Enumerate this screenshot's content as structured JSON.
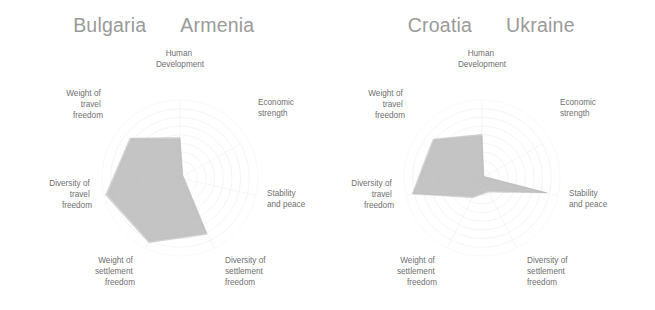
{
  "panels": [
    {
      "titles": [
        "Bulgaria",
        "Armenia"
      ],
      "series": [
        {
          "name": "Bulgaria",
          "values": [
            0.52,
            0.05,
            0.06,
            0.8,
            0.92,
            0.98,
            0.82
          ]
        },
        {
          "name": "Armenia",
          "values": [
            0.5,
            0.04,
            0.05,
            0.78,
            0.9,
            0.95,
            0.8
          ]
        }
      ]
    },
    {
      "titles": [
        "Croatia",
        "Ukraine"
      ],
      "series": [
        {
          "name": "Croatia",
          "values": [
            0.56,
            0.03,
            0.86,
            0.2,
            0.28,
            0.92,
            0.8
          ]
        },
        {
          "name": "Ukraine",
          "values": [
            0.54,
            0.03,
            0.84,
            0.18,
            0.26,
            0.9,
            0.78
          ]
        }
      ]
    }
  ],
  "axes": [
    {
      "id": "human-development",
      "lines": [
        "Human",
        "Development"
      ]
    },
    {
      "id": "economic-strength",
      "lines": [
        "Economic",
        "strength"
      ]
    },
    {
      "id": "stability-and-peace",
      "lines": [
        "Stability",
        "and peace"
      ]
    },
    {
      "id": "diversity-of-settlement-freedom",
      "lines": [
        "Diversity of",
        "settlement",
        "freedom"
      ]
    },
    {
      "id": "weight-of-settlement-freedom",
      "lines": [
        "Weight of",
        "settlement",
        "freedom"
      ]
    },
    {
      "id": "diversity-of-travel-freedom",
      "lines": [
        "Diversity of",
        "travel",
        "freedom"
      ]
    },
    {
      "id": "weight-of-travel-freedom",
      "lines": [
        "Weight of",
        "travel",
        "freedom"
      ]
    }
  ],
  "chart_data": {
    "type": "radar",
    "title": "",
    "charts": [
      {
        "subplot": 1,
        "legend": [
          "Bulgaria",
          "Armenia"
        ],
        "categories": [
          "Human Development",
          "Economic strength",
          "Stability and peace",
          "Diversity of settlement freedom",
          "Weight of settlement freedom",
          "Diversity of travel freedom",
          "Weight of travel freedom"
        ],
        "series": [
          {
            "name": "Bulgaria",
            "values": [
              0.52,
              0.05,
              0.06,
              0.8,
              0.92,
              0.98,
              0.82
            ]
          },
          {
            "name": "Armenia",
            "values": [
              0.5,
              0.04,
              0.05,
              0.78,
              0.9,
              0.95,
              0.8
            ]
          }
        ],
        "rlim": [
          0,
          1
        ],
        "grid": true,
        "grid_rings": 9,
        "legend_position": "top"
      },
      {
        "subplot": 2,
        "legend": [
          "Croatia",
          "Ukraine"
        ],
        "categories": [
          "Human Development",
          "Economic strength",
          "Stability and peace",
          "Diversity of settlement freedom",
          "Weight of settlement freedom",
          "Diversity of travel freedom",
          "Weight of travel freedom"
        ],
        "series": [
          {
            "name": "Croatia",
            "values": [
              0.56,
              0.03,
              0.86,
              0.2,
              0.28,
              0.92,
              0.8
            ]
          },
          {
            "name": "Ukraine",
            "values": [
              0.54,
              0.03,
              0.84,
              0.18,
              0.26,
              0.9,
              0.78
            ]
          }
        ],
        "rlim": [
          0,
          1
        ],
        "grid": true,
        "grid_rings": 9,
        "legend_position": "top"
      }
    ],
    "colors": {
      "fill": "#b9b9b9",
      "grid": "#f0eff1",
      "label_text": "#6f6f6f",
      "title_text": "#9a9a9a",
      "background": "#ffffff"
    }
  }
}
